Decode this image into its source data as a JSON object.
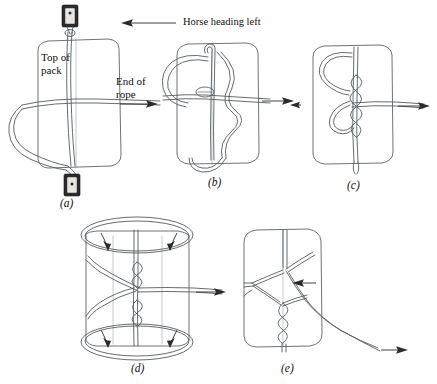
{
  "figure": {
    "title_annotation": "Horse heading left",
    "direction_icon": "left-arrow-icon",
    "background_color": "#ffffff",
    "line_color": "#555b60",
    "ink_color": "#2b2b2b"
  },
  "annotations": {
    "top_of_pack": "Top of\npack",
    "end_of_rope": "End of\nrope"
  },
  "panels": [
    {
      "id": "a",
      "caption": "(a)",
      "description": "Rope laid over top of pack with cinch rings at both ends",
      "labels": [
        "Top of pack",
        "End of rope"
      ],
      "hardware": [
        "cinch-ring-top",
        "cinch-ring-bottom"
      ],
      "arrows": [
        "end-of-rope-right-arrow"
      ]
    },
    {
      "id": "b",
      "caption": "(b)",
      "description": "Rope wrapped around pack forming a central loop",
      "labels": [],
      "hardware": [],
      "arrows": [
        "pull-right-arrow"
      ]
    },
    {
      "id": "c",
      "caption": "(c)",
      "description": "Twists drawn up tight forming the vertical braid",
      "labels": [],
      "hardware": [],
      "arrows": [
        "pull-right-arrow",
        "pull-left-arrow"
      ]
    },
    {
      "id": "d",
      "caption": "(d)",
      "description": "Side loops opened out, arrows show loops being drawn down over the packs",
      "labels": [],
      "hardware": [],
      "arrows": [
        "loop-in-arrow-top-left",
        "loop-in-arrow-top-right",
        "loop-in-arrow-bottom-left",
        "loop-in-arrow-bottom-right",
        "pull-right-arrow"
      ]
    },
    {
      "id": "e",
      "caption": "(e)",
      "description": "Finished diamond hitch with free end drawn off to the right",
      "labels": [],
      "hardware": [],
      "arrows": [
        "diamond-point-arrow",
        "tail-right-arrow"
      ]
    }
  ]
}
